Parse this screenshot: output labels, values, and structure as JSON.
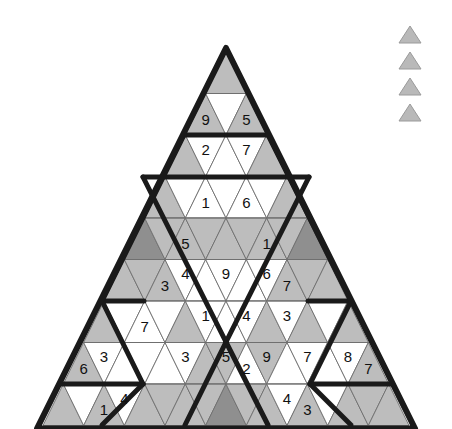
{
  "puzzle": {
    "title": "Triangular Sudoku Grid",
    "rows_count": 9,
    "colors": {
      "light": "#bdbdbd",
      "white": "#ffffff",
      "dark": "#8f8f8f",
      "outline": "#1a1a1a",
      "thin_line": "#6e6e6e",
      "digit": "#111111",
      "legend": "#b9b9b9"
    },
    "geometry": {
      "apex_x": 226,
      "apex_y": 52,
      "row_height": 41.5,
      "half_base": 183
    },
    "rows": [
      {
        "index": 1,
        "cells": [
          {
            "dir": "up",
            "shade": "light",
            "value": ""
          }
        ]
      },
      {
        "index": 2,
        "cells": [
          {
            "dir": "up",
            "shade": "light",
            "value": "9"
          },
          {
            "dir": "down",
            "shade": "white",
            "value": ""
          },
          {
            "dir": "up",
            "shade": "light",
            "value": "5"
          }
        ]
      },
      {
        "index": 3,
        "cells": [
          {
            "dir": "up",
            "shade": "light",
            "value": ""
          },
          {
            "dir": "down",
            "shade": "white",
            "value": "2"
          },
          {
            "dir": "up",
            "shade": "white",
            "value": ""
          },
          {
            "dir": "down",
            "shade": "white",
            "value": "7"
          },
          {
            "dir": "up",
            "shade": "light",
            "value": ""
          }
        ]
      },
      {
        "index": 4,
        "cells": [
          {
            "dir": "up",
            "shade": "light",
            "value": ""
          },
          {
            "dir": "down",
            "shade": "white",
            "value": ""
          },
          {
            "dir": "up",
            "shade": "white",
            "value": "1"
          },
          {
            "dir": "down",
            "shade": "white",
            "value": ""
          },
          {
            "dir": "up",
            "shade": "white",
            "value": "6"
          },
          {
            "dir": "down",
            "shade": "white",
            "value": ""
          },
          {
            "dir": "up",
            "shade": "light",
            "value": ""
          }
        ]
      },
      {
        "index": 5,
        "cells": [
          {
            "dir": "up",
            "shade": "dark",
            "value": ""
          },
          {
            "dir": "down",
            "shade": "light",
            "value": ""
          },
          {
            "dir": "up",
            "shade": "light",
            "value": "5"
          },
          {
            "dir": "down",
            "shade": "light",
            "value": ""
          },
          {
            "dir": "up",
            "shade": "light",
            "value": ""
          },
          {
            "dir": "down",
            "shade": "light",
            "value": ""
          },
          {
            "dir": "up",
            "shade": "light",
            "value": "1"
          },
          {
            "dir": "down",
            "shade": "light",
            "value": ""
          },
          {
            "dir": "up",
            "shade": "dark",
            "value": ""
          }
        ]
      },
      {
        "index": 6,
        "cells": [
          {
            "dir": "up",
            "shade": "light",
            "value": ""
          },
          {
            "dir": "down",
            "shade": "light",
            "value": ""
          },
          {
            "dir": "up",
            "shade": "light",
            "value": "3"
          },
          {
            "dir": "down",
            "shade": "white",
            "value": "4"
          },
          {
            "dir": "up",
            "shade": "white",
            "value": ""
          },
          {
            "dir": "down",
            "shade": "white",
            "value": "9"
          },
          {
            "dir": "up",
            "shade": "white",
            "value": ""
          },
          {
            "dir": "down",
            "shade": "white",
            "value": "6"
          },
          {
            "dir": "up",
            "shade": "light",
            "value": "7"
          },
          {
            "dir": "down",
            "shade": "light",
            "value": ""
          },
          {
            "dir": "up",
            "shade": "light",
            "value": ""
          }
        ]
      },
      {
        "index": 7,
        "cells": [
          {
            "dir": "up",
            "shade": "light",
            "value": ""
          },
          {
            "dir": "down",
            "shade": "white",
            "value": ""
          },
          {
            "dir": "up",
            "shade": "white",
            "value": "7"
          },
          {
            "dir": "down",
            "shade": "white",
            "value": ""
          },
          {
            "dir": "up",
            "shade": "light",
            "value": ""
          },
          {
            "dir": "down",
            "shade": "white",
            "value": "1"
          },
          {
            "dir": "up",
            "shade": "white",
            "value": ""
          },
          {
            "dir": "down",
            "shade": "white",
            "value": "4"
          },
          {
            "dir": "up",
            "shade": "light",
            "value": ""
          },
          {
            "dir": "down",
            "shade": "white",
            "value": "3"
          },
          {
            "dir": "up",
            "shade": "light",
            "value": ""
          },
          {
            "dir": "down",
            "shade": "white",
            "value": ""
          },
          {
            "dir": "up",
            "shade": "light",
            "value": ""
          }
        ]
      },
      {
        "index": 8,
        "cells": [
          {
            "dir": "up",
            "shade": "light",
            "value": "6"
          },
          {
            "dir": "down",
            "shade": "white",
            "value": "3"
          },
          {
            "dir": "up",
            "shade": "white",
            "value": ""
          },
          {
            "dir": "down",
            "shade": "white",
            "value": ""
          },
          {
            "dir": "up",
            "shade": "white",
            "value": ""
          },
          {
            "dir": "down",
            "shade": "white",
            "value": "3"
          },
          {
            "dir": "up",
            "shade": "light",
            "value": ""
          },
          {
            "dir": "down",
            "shade": "light",
            "value": "5"
          },
          {
            "dir": "up",
            "shade": "white",
            "value": "2"
          },
          {
            "dir": "down",
            "shade": "light",
            "value": "9"
          },
          {
            "dir": "up",
            "shade": "white",
            "value": ""
          },
          {
            "dir": "down",
            "shade": "white",
            "value": "7"
          },
          {
            "dir": "up",
            "shade": "white",
            "value": ""
          },
          {
            "dir": "down",
            "shade": "white",
            "value": "8"
          },
          {
            "dir": "up",
            "shade": "light",
            "value": "7"
          }
        ]
      },
      {
        "index": 9,
        "cells": [
          {
            "dir": "up",
            "shade": "light",
            "value": ""
          },
          {
            "dir": "down",
            "shade": "white",
            "value": ""
          },
          {
            "dir": "up",
            "shade": "light",
            "value": "1"
          },
          {
            "dir": "down",
            "shade": "white",
            "value": "4"
          },
          {
            "dir": "up",
            "shade": "light",
            "value": ""
          },
          {
            "dir": "down",
            "shade": "light",
            "value": ""
          },
          {
            "dir": "up",
            "shade": "light",
            "value": ""
          },
          {
            "dir": "down",
            "shade": "light",
            "value": ""
          },
          {
            "dir": "up",
            "shade": "dark",
            "value": ""
          },
          {
            "dir": "down",
            "shade": "light",
            "value": ""
          },
          {
            "dir": "up",
            "shade": "light",
            "value": ""
          },
          {
            "dir": "down",
            "shade": "white",
            "value": "4"
          },
          {
            "dir": "up",
            "shade": "light",
            "value": "3"
          },
          {
            "dir": "down",
            "shade": "white",
            "value": ""
          },
          {
            "dir": "up",
            "shade": "light",
            "value": ""
          },
          {
            "dir": "down",
            "shade": "light",
            "value": ""
          },
          {
            "dir": "up",
            "shade": "light",
            "value": ""
          }
        ]
      }
    ],
    "region_dividers": [
      {
        "name": "row2-row3-boundary",
        "from": [
          184,
          135
        ],
        "to": [
          268,
          135
        ]
      },
      {
        "name": "row4-top-boundary",
        "from": [
          143,
          177
        ],
        "to": [
          309,
          177
        ]
      },
      {
        "name": "row6-row7-boundary",
        "from": [
          102,
          301
        ],
        "to": [
          144,
          301
        ]
      },
      {
        "name": "row6-row7-boundary-right",
        "from": [
          308,
          301
        ],
        "to": [
          351,
          301
        ]
      },
      {
        "name": "region-diag-left-down",
        "from": [
          184,
          135
        ],
        "to": [
          102,
          301
        ]
      },
      {
        "name": "region-diag-right-down",
        "from": [
          268,
          135
        ],
        "to": [
          351,
          301
        ]
      },
      {
        "name": "region-diag-center-left",
        "from": [
          143,
          177
        ],
        "to": [
          226,
          342
        ]
      },
      {
        "name": "region-diag-center-right",
        "from": [
          309,
          177
        ],
        "to": [
          226,
          342
        ]
      },
      {
        "name": "region-diag-bottom-left",
        "from": [
          226,
          342
        ],
        "to": [
          185,
          425
        ]
      },
      {
        "name": "region-diag-bottom-right",
        "from": [
          226,
          342
        ],
        "to": [
          268,
          425
        ]
      },
      {
        "name": "region-diag-lower-left-v",
        "from": [
          102,
          301
        ],
        "to": [
          143,
          384
        ]
      },
      {
        "name": "region-diag-lower-right-v",
        "from": [
          351,
          301
        ],
        "to": [
          310,
          384
        ]
      },
      {
        "name": "region-lower-left-out",
        "from": [
          143,
          384
        ],
        "to": [
          102,
          425
        ]
      },
      {
        "name": "region-lower-right-out",
        "from": [
          310,
          384
        ],
        "to": [
          351,
          425
        ]
      },
      {
        "name": "row8-left-boundary",
        "from": [
          60,
          384
        ],
        "to": [
          143,
          384
        ]
      },
      {
        "name": "row8-right-boundary",
        "from": [
          310,
          384
        ],
        "to": [
          392,
          384
        ]
      }
    ],
    "legend_markers": [
      {
        "name": "marker-1"
      },
      {
        "name": "marker-2"
      },
      {
        "name": "marker-3"
      },
      {
        "name": "marker-4"
      }
    ]
  }
}
